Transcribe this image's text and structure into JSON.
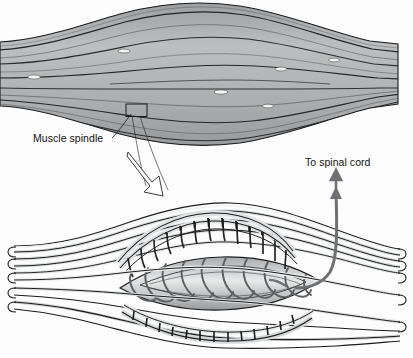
{
  "figure": {
    "background_color": "#fdfdfd",
    "width": 413,
    "height": 358
  },
  "labels": {
    "muscle_spindle": "Muscle spindle",
    "to_spinal_cord": "To spinal cord"
  },
  "panels": {
    "upper": {
      "name": "whole-muscle-belly",
      "description": "Fusiform skeletal muscle belly with extrafusal fibers",
      "fiber_color": "#b0b2b4",
      "fiber_line_color": "#1d1d1d",
      "spindle_marker_color": "#f2f2ee",
      "spindle_marker_count": 6
    },
    "lower": {
      "name": "muscle-spindle-detail",
      "description": "Magnified muscle spindle with intrafusal fibers and annulospiral nerve endings",
      "fiber_color": "#c8cacb",
      "capsule_color": "#cfd1d2",
      "nerve_color": "#5c5e60",
      "outline_color": "#1a1a1a"
    }
  },
  "annotations": {
    "callout_box": {
      "name": "spindle-callout-box",
      "stroke": "#1a1a1a"
    },
    "magnify_arrow": {
      "name": "magnify-arrow",
      "style": "hollow-outline",
      "direction": "down-right"
    },
    "spinal_arrow": {
      "name": "spinal-cord-arrow",
      "style": "solid-curved",
      "color": "#6e7073",
      "direction": "up-right"
    },
    "spinal_arrow_up": {
      "name": "to-spinal-cord-arrow-up",
      "color": "#6e7073"
    }
  }
}
